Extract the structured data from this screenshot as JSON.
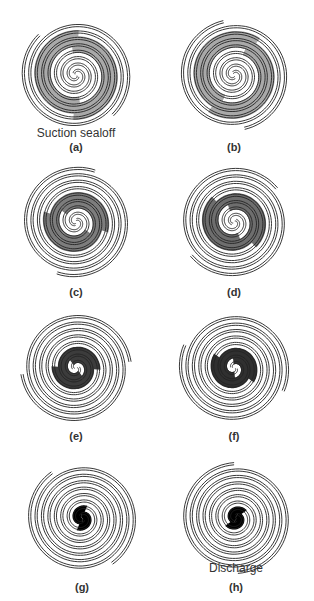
{
  "figure": {
    "panels": [
      {
        "id": "a",
        "label": "(a)",
        "caption": "Suction sealoff",
        "cx": 76,
        "cy": 75,
        "fill": "#a9a9a9",
        "pocket": "outer",
        "labelY": 141,
        "captionY": 126
      },
      {
        "id": "b",
        "label": "(b)",
        "caption": "",
        "cx": 234,
        "cy": 75,
        "fill": "#a9a9a9",
        "pocket": "outer",
        "labelY": 141,
        "captionY": 0
      },
      {
        "id": "c",
        "label": "(c)",
        "caption": "",
        "cx": 76,
        "cy": 222,
        "fill": "#7d7d7d",
        "pocket": "mid",
        "labelY": 286,
        "captionY": 0
      },
      {
        "id": "d",
        "label": "(d)",
        "caption": "",
        "cx": 234,
        "cy": 222,
        "fill": "#6e6e6e",
        "pocket": "mid",
        "labelY": 286,
        "captionY": 0
      },
      {
        "id": "e",
        "label": "(e)",
        "caption": "",
        "cx": 76,
        "cy": 368,
        "fill": "#3c3c3c",
        "pocket": "inner",
        "labelY": 430,
        "captionY": 0
      },
      {
        "id": "f",
        "label": "(f)",
        "caption": "",
        "cx": 234,
        "cy": 368,
        "fill": "#303030",
        "pocket": "inner",
        "labelY": 430,
        "captionY": 0
      },
      {
        "id": "g",
        "label": "(g)",
        "caption": "",
        "cx": 82,
        "cy": 518,
        "fill": "#000000",
        "pocket": "core",
        "labelY": 581,
        "captionY": 0
      },
      {
        "id": "h",
        "label": "(h)",
        "caption": "Discharge",
        "cx": 236,
        "cy": 518,
        "fill": "#000000",
        "pocket": "core",
        "labelY": 581,
        "captionY": 561
      }
    ],
    "line_color": "#222222"
  }
}
